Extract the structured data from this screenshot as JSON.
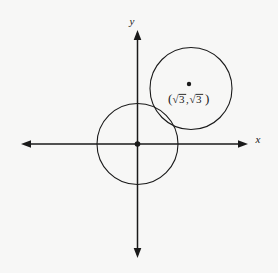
{
  "figure": {
    "background_color": "#f7f7f6",
    "stroke_color": "#1a1a1a",
    "width": 278,
    "height": 273
  },
  "axes": {
    "x_label": "x",
    "y_label": "y",
    "origin": {
      "x": 137.5,
      "y": 144
    },
    "x_axis": {
      "from_x": 21,
      "to_x": 248,
      "y": 144,
      "arrows": "both"
    },
    "y_axis": {
      "x": 137.5,
      "from_y": 30,
      "to_y": 258,
      "arrows": "both"
    },
    "origin_dot": true
  },
  "shapes": [
    {
      "name": "circle-at-origin",
      "type": "circle",
      "cx": 137.5,
      "cy": 144,
      "r": 40.5,
      "fill": "none",
      "stroke": "#1a1a1a"
    },
    {
      "name": "circle-tangent",
      "type": "circle",
      "cx": 191,
      "cy": 88.5,
      "r": 41,
      "fill": "none",
      "stroke": "#1a1a1a"
    }
  ],
  "annotations": {
    "center_point": {
      "name": "center-point-marker",
      "cx": 189,
      "cy": 84,
      "r": 2.2
    },
    "center_label": {
      "text": "(√3,√3)",
      "open_paren": "(",
      "radical_symbol": "√",
      "value_one": "3",
      "separator": ",",
      "value_two": "3",
      "close_paren": ")",
      "x": 189,
      "y": 102
    }
  }
}
